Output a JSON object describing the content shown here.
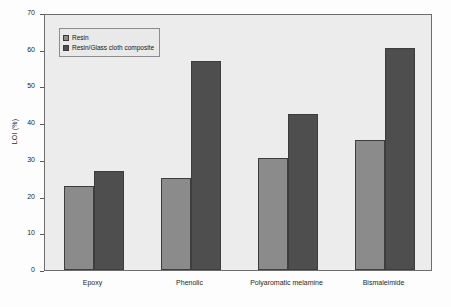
{
  "chart_data": {
    "type": "bar",
    "title": "",
    "xlabel": "",
    "ylabel": "LOI (%)",
    "ylim": [
      0,
      70
    ],
    "yticks": [
      0,
      10,
      20,
      30,
      40,
      50,
      60,
      70
    ],
    "grid": false,
    "legend_position": "top-left",
    "categories": [
      "Epoxy",
      "Phenolic",
      "Polyaromatic melamine",
      "Bismaleimide"
    ],
    "series": [
      {
        "name": "Resin",
        "color": "#8b8b8b",
        "values": [
          23,
          25,
          30.5,
          35.5
        ]
      },
      {
        "name": "Resin/Glass cloth composite",
        "color": "#4e4e4e",
        "values": [
          27,
          57,
          42.5,
          60.5
        ]
      }
    ]
  },
  "axes": {
    "y_axis_label": "LOI (%)",
    "y_tick_labels": [
      "0",
      "10",
      "20",
      "30",
      "40",
      "50",
      "60",
      "70"
    ],
    "x_tick_labels": [
      "Epoxy",
      "Phenolic",
      "Polyaromatic melamine",
      "Bismaleimide"
    ]
  },
  "legend": {
    "entries": [
      {
        "label": "Resin",
        "swatch_color": "#8b8b8b"
      },
      {
        "label": "Resin/Glass cloth composite",
        "swatch_color": "#4e4e4e"
      }
    ]
  },
  "colors": {
    "plot_background": "#ececec",
    "figure_background": "#fdfdfd",
    "axis_line": "#6e6e6e",
    "text": "#1f1f1f"
  }
}
